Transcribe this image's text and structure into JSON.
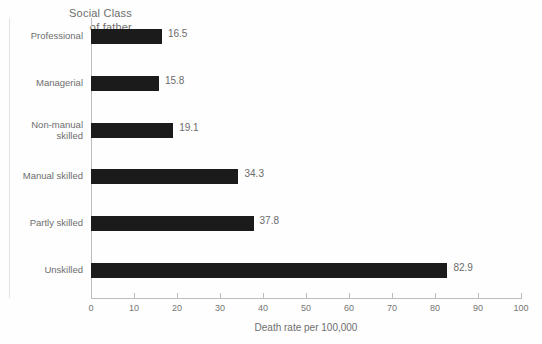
{
  "chart_data": {
    "type": "bar",
    "orientation": "horizontal",
    "title": "Social Class of father",
    "title_line1": "Social Class",
    "title_line2": "of father",
    "xlabel": "Death rate per 100,000",
    "ylabel": "Social Class of father",
    "xlim": [
      0,
      100
    ],
    "xticks": [
      0,
      10,
      20,
      30,
      40,
      50,
      60,
      70,
      80,
      90,
      100
    ],
    "xtick_labels": [
      "0",
      "10",
      "20",
      "30",
      "40",
      "50",
      "60",
      "70",
      "80",
      "90",
      "100"
    ],
    "grid": false,
    "legend": false,
    "bar_color": "#1b1b1b",
    "axis_color": "#bcbcbc",
    "text_color": "#6d6d6d",
    "categories": [
      "Professional",
      "Managerial",
      "Non-manual skilled",
      "Manual skilled",
      "Partly skilled",
      "Unskilled"
    ],
    "category_labels": [
      "Professional",
      "Managerial",
      "Non-manual\nskilled",
      "Manual skilled",
      "Partly skilled",
      "Unskilled"
    ],
    "values": [
      16.5,
      15.8,
      19.1,
      34.3,
      37.8,
      82.9
    ],
    "value_labels": [
      "16.5",
      "15.8",
      "19.1",
      "34.3",
      "37.8",
      "82.9"
    ]
  }
}
